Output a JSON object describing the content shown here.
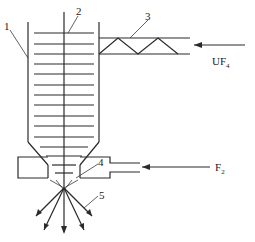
{
  "diagram": {
    "labels": {
      "l1": "1",
      "l2": "2",
      "l3": "3",
      "l4": "4",
      "l5": "5"
    },
    "inputs": {
      "uf4": {
        "main": "UF",
        "sub": "4"
      },
      "f2": {
        "main": "F",
        "sub": "2"
      }
    },
    "components": [
      "reactor-vessel-wall",
      "central-shaft",
      "screw-feeder",
      "nozzle",
      "spray-jets"
    ],
    "colors": {
      "line": "#2a2a2a",
      "background": "#ffffff"
    }
  }
}
